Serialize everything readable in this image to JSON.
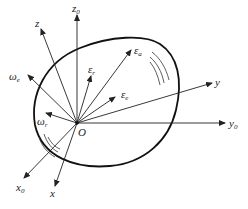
{
  "diagram": {
    "origin": {
      "label": "O",
      "x": 77,
      "y": 123
    },
    "body_outline": {
      "shape": "closed-curve",
      "color": "#111111"
    },
    "axes": [
      {
        "id": "z0",
        "label": "z",
        "sub": "0",
        "to": [
          77,
          8
        ]
      },
      {
        "id": "z",
        "label": "z",
        "sub": "",
        "to": [
          41,
          29
        ]
      },
      {
        "id": "y",
        "label": "y",
        "sub": "",
        "to": [
          212,
          83
        ]
      },
      {
        "id": "y0",
        "label": "y",
        "sub": "0",
        "to": [
          225,
          123
        ]
      },
      {
        "id": "x0",
        "label": "x",
        "sub": "0",
        "to": [
          24,
          178
        ]
      },
      {
        "id": "x",
        "label": "x",
        "sub": "",
        "to": [
          55,
          186
        ]
      }
    ],
    "vectors": [
      {
        "id": "omega-e",
        "label": "ω",
        "sub": "e",
        "to": [
          28,
          75
        ]
      },
      {
        "id": "omega-r",
        "label": "ω",
        "sub": "r",
        "to": [
          46,
          113
        ]
      },
      {
        "id": "epsilon-r",
        "label": "ε",
        "sub": "r",
        "to": [
          91,
          76
        ]
      },
      {
        "id": "epsilon-a",
        "label": "ε",
        "sub": "a",
        "to": [
          131,
          50
        ]
      },
      {
        "id": "epsilon-e",
        "label": "ε",
        "sub": "e",
        "to": [
          115,
          97
        ]
      }
    ],
    "hatch_marks": [
      {
        "position": "upper-right",
        "count": 3
      },
      {
        "position": "lower-left",
        "count": 3
      }
    ]
  }
}
